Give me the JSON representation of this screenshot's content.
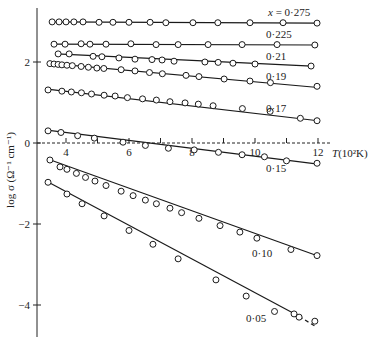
{
  "chart_data": {
    "type": "scatter",
    "title": "",
    "xlabel": "T(10²K)",
    "ylabel": "log σ (Ω⁻¹ cm⁻¹)",
    "xlim": [
      3.0,
      12.6
    ],
    "ylim": [
      -5.0,
      3.4
    ],
    "x_ticks": [
      4,
      5,
      6,
      7,
      8,
      9,
      10,
      11,
      12
    ],
    "x_tick_labels": [
      "4",
      "",
      "6",
      "",
      "8",
      "",
      "10",
      "",
      "12"
    ],
    "y_ticks": [
      2,
      0,
      -2,
      -4
    ],
    "y_tick_labels": [
      "2",
      "0",
      "−2",
      "−4"
    ],
    "grid": false,
    "legend_position": "inline labels",
    "series": [
      {
        "name": "x = 0·275",
        "label": "x = 0·275",
        "label_pos": [
          268,
          16
        ],
        "x": [
          3.56,
          3.78,
          4.0,
          4.25,
          4.54,
          5.05,
          5.49,
          6.0,
          6.67,
          7.17,
          8.03,
          8.82,
          9.84,
          10.89,
          11.97
        ],
        "y": [
          2.99,
          2.99,
          2.99,
          2.99,
          2.99,
          2.98,
          2.98,
          2.98,
          2.98,
          2.97,
          2.97,
          2.97,
          2.97,
          2.97,
          2.96
        ],
        "line": [
          [
            3.5,
            2.99
          ],
          [
            12.0,
            2.96
          ]
        ]
      },
      {
        "name": "0·225",
        "label": "0·225",
        "label_pos": [
          266,
          38
        ],
        "x": [
          3.62,
          3.97,
          4.48,
          4.76,
          5.27,
          6.06,
          6.86,
          7.56,
          8.51,
          9.59,
          10.7,
          11.9
        ],
        "y": [
          2.44,
          2.44,
          2.45,
          2.44,
          2.44,
          2.45,
          2.43,
          2.43,
          2.43,
          2.43,
          2.43,
          2.42
        ],
        "line": [
          [
            3.6,
            2.44
          ],
          [
            12.0,
            2.42
          ]
        ]
      },
      {
        "name": "0·21",
        "label": "0·21",
        "label_pos": [
          266,
          60
        ],
        "x": [
          3.75,
          4.1,
          4.86,
          5.14,
          5.68,
          6.19,
          6.73,
          7.05,
          7.43,
          8.41,
          8.83,
          9.3,
          10.0,
          11.78
        ],
        "y": [
          2.2,
          2.2,
          2.14,
          2.13,
          2.1,
          2.07,
          2.06,
          2.05,
          2.02,
          2.0,
          1.99,
          1.97,
          1.95,
          1.9
        ],
        "line": [
          [
            3.7,
            2.2
          ],
          [
            11.8,
            1.9
          ]
        ]
      },
      {
        "name": "0·19",
        "label": "0·19",
        "label_pos": [
          266,
          80
        ],
        "x": [
          3.49,
          3.62,
          3.75,
          3.87,
          4.03,
          4.2,
          4.48,
          4.71,
          4.98,
          5.2,
          5.75,
          6.19,
          6.65,
          7.06,
          7.81,
          8.22,
          9.02,
          9.84,
          10.49,
          11.97
        ],
        "y": [
          1.96,
          1.95,
          1.94,
          1.93,
          1.92,
          1.91,
          1.89,
          1.87,
          1.85,
          1.84,
          1.81,
          1.78,
          1.74,
          1.71,
          1.67,
          1.64,
          1.58,
          1.53,
          1.49,
          1.4
        ],
        "line": [
          [
            3.4,
            1.97
          ],
          [
            12.0,
            1.37
          ]
        ]
      },
      {
        "name": "0·17",
        "label": "0·17",
        "label_pos": [
          266,
          112
        ],
        "x": [
          3.43,
          3.87,
          4.17,
          4.49,
          4.81,
          5.21,
          5.56,
          5.95,
          6.43,
          6.87,
          7.3,
          7.78,
          8.2,
          8.67,
          9.6,
          10.48,
          11.44,
          11.97
        ],
        "y": [
          1.31,
          1.28,
          1.26,
          1.24,
          1.21,
          1.18,
          1.16,
          1.12,
          1.09,
          1.06,
          1.02,
          0.99,
          0.96,
          0.92,
          0.85,
          0.78,
          0.61,
          0.55
        ],
        "line": [
          [
            3.4,
            1.33
          ],
          [
            12.0,
            0.55
          ]
        ]
      },
      {
        "name": "0·15",
        "label": "0·15",
        "label_pos": [
          266,
          172
        ],
        "x": [
          3.43,
          3.84,
          4.37,
          4.9,
          5.81,
          6.52,
          7.25,
          8.07,
          8.84,
          9.59,
          10.3,
          11.0,
          11.97
        ],
        "y": [
          0.3,
          0.26,
          0.18,
          0.12,
          0.02,
          -0.06,
          -0.13,
          -0.17,
          -0.23,
          -0.29,
          -0.34,
          -0.44,
          -0.5
        ],
        "line": [
          [
            3.4,
            0.32
          ],
          [
            12.0,
            -0.52
          ]
        ]
      },
      {
        "name": "0·10",
        "label": "0·10",
        "label_pos": [
          252,
          257
        ],
        "x": [
          3.49,
          3.81,
          4.03,
          4.33,
          4.62,
          4.92,
          5.27,
          5.75,
          6.13,
          6.52,
          6.87,
          7.3,
          7.67,
          8.22,
          8.89,
          9.52,
          10.06,
          11.14,
          11.97
        ],
        "y": [
          -0.42,
          -0.59,
          -0.65,
          -0.75,
          -0.85,
          -0.94,
          -1.05,
          -1.19,
          -1.3,
          -1.41,
          -1.5,
          -1.61,
          -1.72,
          -1.86,
          -2.04,
          -2.2,
          -2.35,
          -2.63,
          -2.78
        ],
        "line": [
          [
            3.4,
            -0.39
          ],
          [
            12.0,
            -2.79
          ]
        ]
      },
      {
        "name": "0·05",
        "label": "0·05",
        "label_pos": [
          246,
          322
        ],
        "x": [
          3.43,
          4.03,
          4.51,
          5.21,
          6.0,
          6.76,
          7.56,
          8.76,
          9.72,
          10.62,
          11.24,
          11.4,
          11.9
        ],
        "y": [
          -0.97,
          -1.26,
          -1.5,
          -1.8,
          -2.16,
          -2.5,
          -2.86,
          -3.38,
          -3.78,
          -4.16,
          -4.22,
          -4.3,
          -4.4
        ],
        "line": [
          [
            3.4,
            -0.95
          ],
          [
            11.4,
            -4.28
          ]
        ],
        "dashed_extension": [
          [
            11.4,
            -4.28
          ],
          [
            11.9,
            -4.52
          ]
        ]
      }
    ]
  }
}
